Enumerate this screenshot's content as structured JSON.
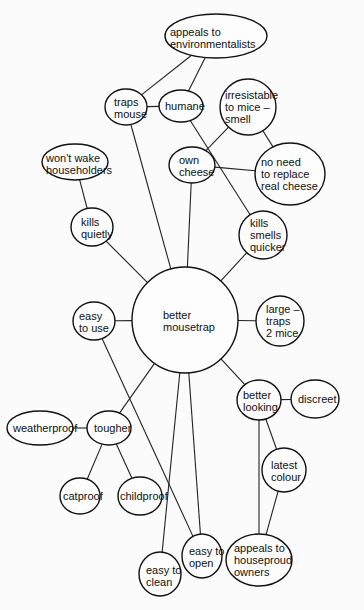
{
  "diagram": {
    "type": "mind-map",
    "central": {
      "id": "center",
      "lines": [
        "better",
        "mousetrap"
      ],
      "cx": 185,
      "cy": 320,
      "rx": 53,
      "ry": 53,
      "tx": 163,
      "ty": 309
    },
    "nodes": [
      {
        "id": "env",
        "lines": [
          "appeals to",
          "environmentalists"
        ],
        "cx": 216,
        "cy": 36,
        "rx": 51,
        "ry": 22,
        "tx": 170,
        "ty": 26
      },
      {
        "id": "traps",
        "lines": [
          "traps",
          "mouse"
        ],
        "cx": 126,
        "cy": 107,
        "rx": 21,
        "ry": 18,
        "tx": 114,
        "ty": 96
      },
      {
        "id": "humane",
        "lines": [
          "humane"
        ],
        "cx": 181,
        "cy": 106,
        "rx": 22,
        "ry": 16,
        "tx": 165,
        "ty": 100
      },
      {
        "id": "irres",
        "lines": [
          "irresistable",
          "to mice –",
          "smell"
        ],
        "cx": 248,
        "cy": 107,
        "rx": 28,
        "ry": 28,
        "tx": 225,
        "ty": 89
      },
      {
        "id": "cheese",
        "lines": [
          "own",
          "cheese"
        ],
        "cx": 192,
        "cy": 165,
        "rx": 23,
        "ry": 18,
        "tx": 179,
        "ty": 154
      },
      {
        "id": "noneed",
        "lines": [
          "no need",
          "to replace",
          "real cheese"
        ],
        "cx": 290,
        "cy": 174,
        "rx": 35,
        "ry": 31,
        "tx": 261,
        "ty": 156
      },
      {
        "id": "wake",
        "lines": [
          "won't wake",
          "householders"
        ],
        "cx": 75,
        "cy": 162,
        "rx": 33,
        "ry": 18,
        "tx": 46,
        "ty": 152
      },
      {
        "id": "quiet",
        "lines": [
          "kills",
          "quietly"
        ],
        "cx": 92,
        "cy": 227,
        "rx": 21,
        "ry": 19,
        "tx": 81,
        "ty": 216
      },
      {
        "id": "smells",
        "lines": [
          "kills",
          "smells",
          "quicker"
        ],
        "cx": 263,
        "cy": 235,
        "rx": 24,
        "ry": 24,
        "tx": 250,
        "ty": 217
      },
      {
        "id": "easyuse",
        "lines": [
          "easy",
          "to use"
        ],
        "cx": 94,
        "cy": 321,
        "rx": 21,
        "ry": 19,
        "tx": 79,
        "ty": 310
      },
      {
        "id": "large",
        "lines": [
          "large –",
          "traps",
          "2 mice"
        ],
        "cx": 280,
        "cy": 321,
        "rx": 24,
        "ry": 25,
        "tx": 266,
        "ty": 303
      },
      {
        "id": "looking",
        "lines": [
          "better",
          "looking"
        ],
        "cx": 259,
        "cy": 400,
        "rx": 22,
        "ry": 20,
        "tx": 243,
        "ty": 389
      },
      {
        "id": "discreet",
        "lines": [
          "discreet"
        ],
        "cx": 315,
        "cy": 399,
        "rx": 24,
        "ry": 19,
        "tx": 298,
        "ty": 393
      },
      {
        "id": "tougher",
        "lines": [
          "tougher"
        ],
        "cx": 109,
        "cy": 428,
        "rx": 22,
        "ry": 17,
        "tx": 94,
        "ty": 422
      },
      {
        "id": "weather",
        "lines": [
          "weatherproof"
        ],
        "cx": 40,
        "cy": 428,
        "rx": 33,
        "ry": 17,
        "tx": 13,
        "ty": 422
      },
      {
        "id": "latest",
        "lines": [
          "latest",
          "colour"
        ],
        "cx": 284,
        "cy": 470,
        "rx": 22,
        "ry": 22,
        "tx": 271,
        "ty": 459
      },
      {
        "id": "cat",
        "lines": [
          "catproof"
        ],
        "cx": 80,
        "cy": 496,
        "rx": 20,
        "ry": 18,
        "tx": 63,
        "ty": 490
      },
      {
        "id": "child",
        "lines": [
          "childproof"
        ],
        "cx": 140,
        "cy": 496,
        "rx": 22,
        "ry": 19,
        "tx": 120,
        "ty": 490
      },
      {
        "id": "open",
        "lines": [
          "easy to",
          "open"
        ],
        "cx": 202,
        "cy": 556,
        "rx": 20,
        "ry": 22,
        "tx": 189,
        "ty": 545
      },
      {
        "id": "proud",
        "lines": [
          "appeals to",
          "houseproud",
          "owners"
        ],
        "cx": 259,
        "cy": 560,
        "rx": 33,
        "ry": 26,
        "tx": 234,
        "ty": 542
      },
      {
        "id": "clean",
        "lines": [
          "easy to",
          "clean"
        ],
        "cx": 160,
        "cy": 574,
        "rx": 21,
        "ry": 22,
        "tx": 146,
        "ty": 564
      }
    ],
    "edges": [
      [
        "traps",
        "env"
      ],
      [
        "humane",
        "env"
      ],
      [
        "traps",
        "humane"
      ],
      [
        "traps",
        "center"
      ],
      [
        "cheese",
        "center"
      ],
      [
        "cheese",
        "irres"
      ],
      [
        "cheese",
        "noneed"
      ],
      [
        "irres",
        "noneed"
      ],
      [
        "humane",
        "smells"
      ],
      [
        "wake",
        "quiet"
      ],
      [
        "quiet",
        "center"
      ],
      [
        "smells",
        "center"
      ],
      [
        "easyuse",
        "center"
      ],
      [
        "easyuse",
        "open"
      ],
      [
        "large",
        "center"
      ],
      [
        "looking",
        "center"
      ],
      [
        "looking",
        "discreet"
      ],
      [
        "looking",
        "latest"
      ],
      [
        "looking",
        "proud"
      ],
      [
        "latest",
        "proud"
      ],
      [
        "tougher",
        "center"
      ],
      [
        "tougher",
        "weather"
      ],
      [
        "tougher",
        "cat"
      ],
      [
        "tougher",
        "child"
      ],
      [
        "clean",
        "center"
      ],
      [
        "open",
        "center"
      ]
    ]
  }
}
